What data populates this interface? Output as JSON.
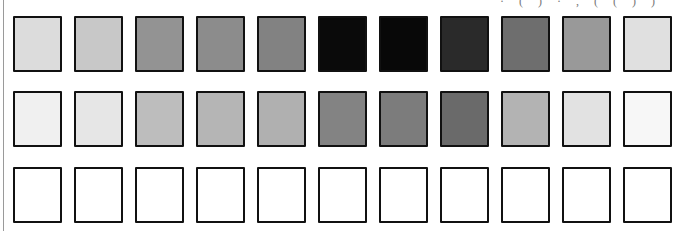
{
  "top_fragment": "· ( ) · , ( ( ) )",
  "rows": [
    {
      "name": "row-1",
      "top": 16,
      "swatches": [
        "#dcdcdc",
        "#c8c8c8",
        "#939393",
        "#8c8c8c",
        "#828282",
        "#0a0a0a",
        "#080808",
        "#2a2a2a",
        "#6e6e6e",
        "#999999",
        "#e0e0e0"
      ]
    },
    {
      "name": "row-2",
      "top": 91,
      "swatches": [
        "#f0f0f0",
        "#e6e6e6",
        "#bdbdbd",
        "#b5b5b5",
        "#b0b0b0",
        "#838383",
        "#7c7c7c",
        "#6a6a6a",
        "#b3b3b3",
        "#e2e2e2",
        "#f7f7f7"
      ]
    },
    {
      "name": "row-3",
      "top": 167,
      "swatches": [
        "#ffffff",
        "#ffffff",
        "#ffffff",
        "#ffffff",
        "#ffffff",
        "#ffffff",
        "#ffffff",
        "#ffffff",
        "#ffffff",
        "#ffffff",
        "#ffffff"
      ]
    }
  ],
  "column_pitch": 61
}
